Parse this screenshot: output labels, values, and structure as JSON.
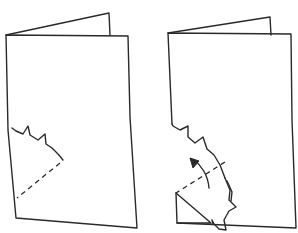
{
  "figure": {
    "panels": [
      {
        "id": "left",
        "label": "Folded card with zig-zag cut line and dashed fold line"
      },
      {
        "id": "right",
        "label": "Card with cut flap folded forward along dashed line, arrow showing fold direction"
      }
    ],
    "colors": {
      "ink": "#2a2a2a",
      "background": "#ffffff"
    }
  }
}
